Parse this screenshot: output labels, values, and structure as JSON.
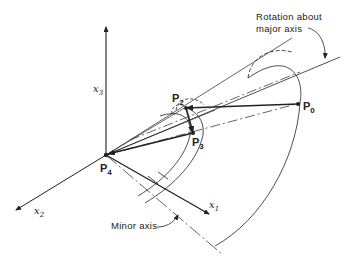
{
  "figure": {
    "type": "3D geometric diagram",
    "points": [
      {
        "id": "P0",
        "base": "P",
        "sub": "0"
      },
      {
        "id": "P2",
        "base": "P",
        "sub": "2"
      },
      {
        "id": "P3",
        "base": "P",
        "sub": "3"
      },
      {
        "id": "P4",
        "base": "P",
        "sub": "4"
      }
    ],
    "axes": [
      {
        "id": "x1",
        "base": "x",
        "sub": "1"
      },
      {
        "id": "x2",
        "base": "x",
        "sub": "2"
      },
      {
        "id": "x3",
        "base": "x",
        "sub": "3"
      }
    ],
    "annotations": {
      "rotation_line1": "Rotation about",
      "rotation_line2": "major axis",
      "minor_axis": "Minor axis"
    },
    "colors": {
      "line": "#222222",
      "background": "#ffffff"
    }
  }
}
